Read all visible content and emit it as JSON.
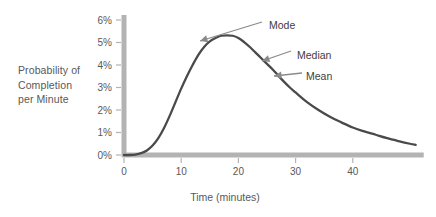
{
  "chart_data": {
    "type": "line",
    "title": "",
    "subtitle": "",
    "xlabel": "Time (minutes)",
    "ylabel": "Probability of Completion per Minute",
    "ylabel_lines": [
      "Probability of",
      "Completion",
      "per Minute"
    ],
    "xlim": [
      0,
      51
    ],
    "ylim": [
      0,
      6
    ],
    "xticks": [
      0,
      10,
      20,
      30,
      40
    ],
    "xtick_labels": [
      "0",
      "10",
      "20",
      "30",
      "40"
    ],
    "yticks": [
      0,
      1,
      2,
      3,
      4,
      5,
      6
    ],
    "ytick_labels": [
      "0%",
      "1%",
      "2%",
      "3%",
      "4%",
      "5%",
      "6%"
    ],
    "grid": false,
    "legend": false,
    "series": [
      {
        "name": "Probability of completion per minute",
        "color": "#4a4a4a",
        "x": [
          0,
          1,
          2,
          3,
          4,
          5,
          6,
          7,
          8,
          9,
          10,
          11,
          12,
          13,
          14,
          15,
          16,
          17,
          18,
          19,
          20,
          21,
          22,
          23,
          24,
          25,
          26,
          27,
          28,
          29,
          30,
          32,
          34,
          36,
          38,
          40,
          42,
          44,
          46,
          48,
          50,
          51
        ],
        "values": [
          0.0,
          0.0,
          0.02,
          0.08,
          0.2,
          0.42,
          0.75,
          1.2,
          1.75,
          2.35,
          2.95,
          3.5,
          4.0,
          4.45,
          4.8,
          5.05,
          5.2,
          5.3,
          5.32,
          5.3,
          5.2,
          5.02,
          4.8,
          4.55,
          4.3,
          4.05,
          3.8,
          3.52,
          3.25,
          3.0,
          2.78,
          2.35,
          2.0,
          1.7,
          1.45,
          1.22,
          1.05,
          0.9,
          0.75,
          0.62,
          0.5,
          0.45
        ]
      }
    ],
    "annotations": [
      {
        "label": "Mode",
        "x": 19,
        "y": 5.32,
        "text_x": 269,
        "text_y": 25,
        "tip_x": 200,
        "tip_y": 41,
        "tail_x": 262,
        "tail_y": 22
      },
      {
        "label": "Median",
        "x": 27,
        "y": 4.35,
        "text_x": 297,
        "text_y": 55,
        "tip_x": 262,
        "tip_y": 61,
        "tail_x": 291,
        "tail_y": 51
      },
      {
        "label": "Mean",
        "x": 31,
        "y": 3.7,
        "text_x": 306,
        "text_y": 76,
        "tip_x": 274,
        "tip_y": 76,
        "tail_x": 302,
        "tail_y": 73
      }
    ],
    "colors": {
      "curve": "#4a4a4a",
      "axis": "#b3b3b3",
      "tick_mark": "#b3b3b3",
      "annotation_arrow": "#8a8a8c",
      "tick_label": "#58585a",
      "annotation_label": "#414042",
      "background": "#ffffff"
    },
    "geometry": {
      "origin_x": 124,
      "origin_y": 155,
      "x_per_unit": 5.72,
      "y_per_unit": 22.5,
      "axis_thickness": 5,
      "curve_width": 2.3
    }
  }
}
